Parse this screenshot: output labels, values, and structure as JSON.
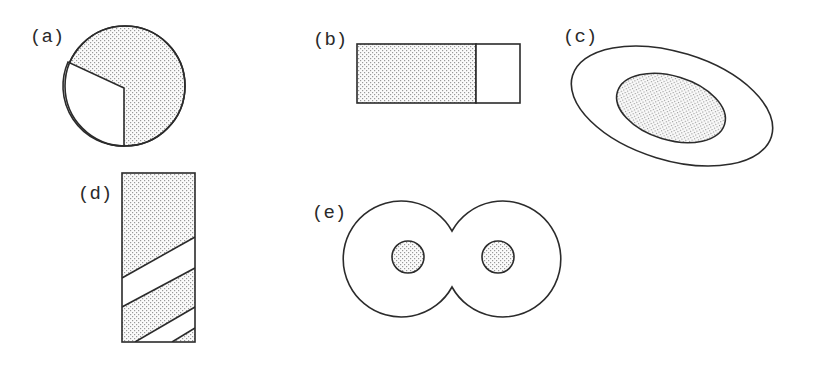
{
  "figures": {
    "a": {
      "label": "(a)",
      "description": "Circle with a shaded sector (about 3/4) and an unshaded wedge on the lower-left"
    },
    "b": {
      "label": "(b)",
      "description": "Rectangle divided into a larger shaded left part and a smaller unshaded right part"
    },
    "c": {
      "label": "(c)",
      "description": "Tilted outer ellipse containing a shaded inner ellipse"
    },
    "d": {
      "label": "(d)",
      "description": "Tall rectangle with shaded top and alternating diagonal shaded/unshaded bands"
    },
    "e": {
      "label": "(e)",
      "description": "Two overlapping circles forming a figure-eight outline, each containing a small shaded circle"
    }
  },
  "colors": {
    "stroke": "#2b2b2b",
    "dot": "#9a9a9a",
    "background": "#ffffff"
  }
}
